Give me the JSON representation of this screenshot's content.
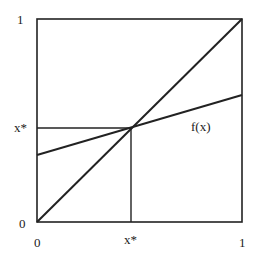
{
  "diagram": {
    "type": "fixed-point",
    "colors": {
      "line": "#222222",
      "background": "#ffffff"
    },
    "labels": {
      "y_top": "1",
      "y_fixed": "x*",
      "y_bottom": "0",
      "x_left": "0",
      "x_fixed": "x*",
      "x_right": "1",
      "function": "f(x)"
    }
  }
}
